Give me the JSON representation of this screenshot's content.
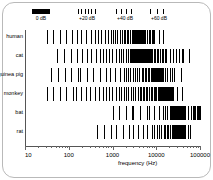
{
  "figure": {
    "background": "#ffffff",
    "frame_color": "#b9b9b9",
    "ink_color": "#000000"
  },
  "legend": {
    "items": [
      {
        "label": "0 dB",
        "style": "solid",
        "ticks": 1
      },
      {
        "label": "+20 dB",
        "style": "dense",
        "ticks": 6
      },
      {
        "label": "+40 dB",
        "style": "medium",
        "ticks": 4
      },
      {
        "label": "+60 dB",
        "style": "sparse",
        "ticks": 3
      }
    ]
  },
  "axis": {
    "x_title": "frequency (Hz)",
    "x_ticklabels": [
      "10",
      "100",
      "1000",
      "10000",
      "100000"
    ],
    "x_tickvalues": [
      10,
      100,
      1000,
      10000,
      100000
    ],
    "x_scale": "log",
    "xlim": [
      10,
      100000
    ],
    "y_categories": [
      "human",
      "cat",
      "guinea pig",
      "monkey",
      "bat",
      "rat"
    ]
  },
  "chart_data": {
    "type": "bar",
    "title": "",
    "subtitle": "",
    "xlabel": "frequency (Hz)",
    "ylabel": "",
    "xlim": [
      10,
      100000
    ],
    "x_scale": "log",
    "grid": false,
    "legend_position": "top",
    "legend_entries": [
      "0 dB",
      "+20 dB",
      "+40 dB",
      "+60 dB"
    ],
    "note": "Audiogram-style hearing-range chart: each row is a species; vertical line density/darkness encodes hearing threshold (sparse lines = +60 dB, solid black = 0 dB).",
    "categories": [
      "human",
      "cat",
      "guinea pig",
      "monkey",
      "bat",
      "rat"
    ],
    "series": [
      {
        "name": "human",
        "range_hz": [
          31,
          19000
        ],
        "best_hz": [
          2000,
          5000
        ],
        "segments": [
          {
            "from_hz": 31,
            "to_hz": 120,
            "level_db": 60
          },
          {
            "from_hz": 120,
            "to_hz": 400,
            "level_db": 50
          },
          {
            "from_hz": 400,
            "to_hz": 900,
            "level_db": 40
          },
          {
            "from_hz": 900,
            "to_hz": 1800,
            "level_db": 25
          },
          {
            "from_hz": 1800,
            "to_hz": 2800,
            "level_db": 15
          },
          {
            "from_hz": 2800,
            "to_hz": 5200,
            "level_db": 0
          },
          {
            "from_hz": 5200,
            "to_hz": 9000,
            "level_db": 20
          },
          {
            "from_hz": 9000,
            "to_hz": 14000,
            "level_db": 45
          },
          {
            "from_hz": 14000,
            "to_hz": 19000,
            "level_db": 60
          }
        ]
      },
      {
        "name": "cat",
        "range_hz": [
          55,
          78000
        ],
        "best_hz": [
          3000,
          8000
        ],
        "segments": [
          {
            "from_hz": 55,
            "to_hz": 200,
            "level_db": 60
          },
          {
            "from_hz": 200,
            "to_hz": 600,
            "level_db": 50
          },
          {
            "from_hz": 600,
            "to_hz": 1400,
            "level_db": 38
          },
          {
            "from_hz": 1400,
            "to_hz": 2600,
            "level_db": 25
          },
          {
            "from_hz": 2600,
            "to_hz": 4200,
            "level_db": 12
          },
          {
            "from_hz": 4200,
            "to_hz": 8000,
            "level_db": 0
          },
          {
            "from_hz": 8000,
            "to_hz": 17000,
            "level_db": 20
          },
          {
            "from_hz": 17000,
            "to_hz": 40000,
            "level_db": 42
          },
          {
            "from_hz": 40000,
            "to_hz": 78000,
            "level_db": 60
          }
        ]
      },
      {
        "name": "guinea pig",
        "range_hz": [
          40,
          50000
        ],
        "best_hz": [
          8000,
          12000
        ],
        "segments": [
          {
            "from_hz": 40,
            "to_hz": 180,
            "level_db": 62
          },
          {
            "from_hz": 180,
            "to_hz": 700,
            "level_db": 55
          },
          {
            "from_hz": 700,
            "to_hz": 2000,
            "level_db": 44
          },
          {
            "from_hz": 2000,
            "to_hz": 5000,
            "level_db": 32
          },
          {
            "from_hz": 5000,
            "to_hz": 8000,
            "level_db": 14
          },
          {
            "from_hz": 8000,
            "to_hz": 14000,
            "level_db": 0
          },
          {
            "from_hz": 14000,
            "to_hz": 26000,
            "level_db": 30
          },
          {
            "from_hz": 26000,
            "to_hz": 50000,
            "level_db": 60
          }
        ]
      },
      {
        "name": "monkey",
        "range_hz": [
          31,
          42000
        ],
        "best_hz": [
          12000,
          20000
        ],
        "segments": [
          {
            "from_hz": 31,
            "to_hz": 150,
            "level_db": 60
          },
          {
            "from_hz": 150,
            "to_hz": 600,
            "level_db": 50
          },
          {
            "from_hz": 600,
            "to_hz": 1600,
            "level_db": 40
          },
          {
            "from_hz": 1600,
            "to_hz": 4500,
            "level_db": 30
          },
          {
            "from_hz": 4500,
            "to_hz": 9000,
            "level_db": 22
          },
          {
            "from_hz": 9000,
            "to_hz": 14000,
            "level_db": 12
          },
          {
            "from_hz": 14000,
            "to_hz": 24000,
            "level_db": 0
          },
          {
            "from_hz": 24000,
            "to_hz": 42000,
            "level_db": 45
          }
        ]
      },
      {
        "name": "bat",
        "range_hz": [
          1000,
          120000
        ],
        "best_hz": [
          25000,
          50000
        ],
        "segments": [
          {
            "from_hz": 1000,
            "to_hz": 3000,
            "level_db": 62
          },
          {
            "from_hz": 3000,
            "to_hz": 7000,
            "level_db": 58
          },
          {
            "from_hz": 7000,
            "to_hz": 14000,
            "level_db": 50
          },
          {
            "from_hz": 14000,
            "to_hz": 22000,
            "level_db": 32
          },
          {
            "from_hz": 22000,
            "to_hz": 45000,
            "level_db": 0
          },
          {
            "from_hz": 45000,
            "to_hz": 70000,
            "level_db": 40
          },
          {
            "from_hz": 70000,
            "to_hz": 120000,
            "level_db": 10
          }
        ]
      },
      {
        "name": "rat",
        "range_hz": [
          450,
          60000
        ],
        "best_hz": [
          30000,
          45000
        ],
        "segments": [
          {
            "from_hz": 450,
            "to_hz": 1200,
            "level_db": 62
          },
          {
            "from_hz": 1200,
            "to_hz": 3000,
            "level_db": 55
          },
          {
            "from_hz": 3000,
            "to_hz": 8000,
            "level_db": 45
          },
          {
            "from_hz": 8000,
            "to_hz": 16000,
            "level_db": 32
          },
          {
            "from_hz": 16000,
            "to_hz": 26000,
            "level_db": 18
          },
          {
            "from_hz": 26000,
            "to_hz": 46000,
            "level_db": 0
          },
          {
            "from_hz": 46000,
            "to_hz": 60000,
            "level_db": 30
          }
        ]
      }
    ]
  }
}
